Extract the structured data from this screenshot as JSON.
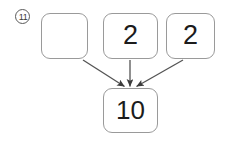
{
  "figure": {
    "item_label": "11",
    "item_label_style": "circled-number",
    "type": "part-part-whole-diagram",
    "colors": {
      "box_border": "#9a9a9a",
      "arrow": "#4a4a4a",
      "text": "#1c1c1c",
      "label": "#3a3a3a",
      "background": "#ffffff"
    }
  },
  "addends": [
    {
      "name": "addend-1",
      "value": "",
      "placeholder": ""
    },
    {
      "name": "addend-2",
      "value": "2"
    },
    {
      "name": "addend-3",
      "value": "2"
    }
  ],
  "sum": {
    "name": "sum",
    "value": "10"
  },
  "arrows": [
    {
      "name": "arrow-from-addend-1",
      "from": "addend-1",
      "to": "sum"
    },
    {
      "name": "arrow-from-addend-2",
      "from": "addend-2",
      "to": "sum"
    },
    {
      "name": "arrow-from-addend-3",
      "from": "addend-3",
      "to": "sum"
    }
  ]
}
